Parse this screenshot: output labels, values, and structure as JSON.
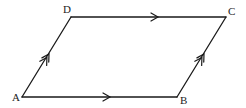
{
  "diagram": {
    "type": "parallelogram",
    "stroke_color": "#1a1a1a",
    "background": "#ffffff",
    "vertices": {
      "A": {
        "label": "A",
        "x": 22,
        "y": 97
      },
      "B": {
        "label": "B",
        "x": 177,
        "y": 97
      },
      "C": {
        "label": "C",
        "x": 226,
        "y": 17
      },
      "D": {
        "label": "D",
        "x": 71,
        "y": 17
      }
    },
    "edges": [
      {
        "from": "A",
        "to": "B",
        "marker": "single-arrow"
      },
      {
        "from": "D",
        "to": "C",
        "marker": "single-arrow"
      },
      {
        "from": "A",
        "to": "D",
        "marker": "double-arrow"
      },
      {
        "from": "B",
        "to": "C",
        "marker": "double-arrow"
      }
    ]
  }
}
